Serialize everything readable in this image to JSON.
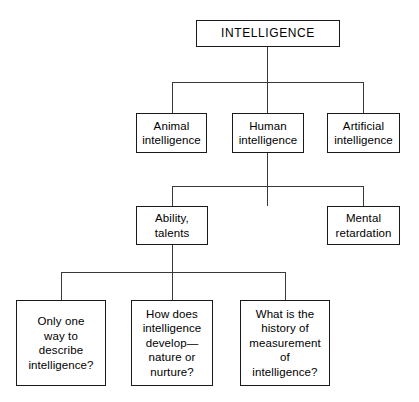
{
  "diagram": {
    "title": "INTELLIGENCE",
    "type": "hierarchy-tree",
    "colors": {
      "background": "#ffffff",
      "node_fill": "#ffffff",
      "node_border": "#1a1a1a",
      "connector": "#3a3a3a",
      "text": "#000000"
    },
    "levels": [
      {
        "level": 1,
        "nodes": [
          {
            "id": "intelligence",
            "label": "INTELLIGENCE"
          }
        ]
      },
      {
        "level": 2,
        "nodes": [
          {
            "id": "animal",
            "label": "Animal\nintelligence"
          },
          {
            "id": "human",
            "label": "Human\nintelligence"
          },
          {
            "id": "artificial",
            "label": "Artificial\nintelligence"
          }
        ]
      },
      {
        "level": 3,
        "nodes": [
          {
            "id": "ability",
            "label": "Ability,\ntalents"
          },
          {
            "id": "mental",
            "label": "Mental\nretardation"
          }
        ]
      },
      {
        "level": 4,
        "nodes": [
          {
            "id": "q1",
            "label": "Only one\nway to\ndescribe\nintelligence?"
          },
          {
            "id": "q2",
            "label": "How does\nintelligence\ndevelop—\nnature or\nnurture?"
          },
          {
            "id": "q3",
            "label": "What is the\nhistory of\nmeasurement\nof\nintelligence?"
          }
        ]
      }
    ],
    "edges": [
      {
        "from": "intelligence",
        "to": "animal"
      },
      {
        "from": "intelligence",
        "to": "human"
      },
      {
        "from": "intelligence",
        "to": "artificial"
      },
      {
        "from": "human",
        "to": "ability"
      },
      {
        "from": "human",
        "to": "mental"
      },
      {
        "from": "ability",
        "to": "q1"
      },
      {
        "from": "ability",
        "to": "q2"
      },
      {
        "from": "ability",
        "to": "q3"
      }
    ]
  }
}
